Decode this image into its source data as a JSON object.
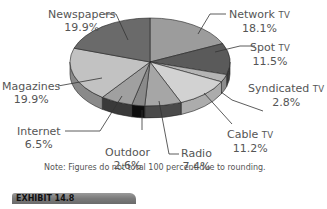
{
  "chart_data": {
    "type": "pie",
    "style": "3d-exploded-none",
    "title": "",
    "start_angle_deg": -90,
    "direction": "clockwise",
    "slices": [
      {
        "label": "Network TV",
        "value": 18.1,
        "display": "18.1%",
        "color": "#9c9c9c"
      },
      {
        "label": "Spot TV",
        "value": 11.5,
        "display": "11.5%",
        "color": "#5a5a5a"
      },
      {
        "label": "Syndicated TV",
        "value": 2.8,
        "display": "2.8%",
        "color": "#b4b4b4"
      },
      {
        "label": "Cable TV",
        "value": 11.2,
        "display": "11.2%",
        "color": "#d2d2d2"
      },
      {
        "label": "Radio",
        "value": 7.4,
        "display": "7.4%",
        "color": "#a6a6a6"
      },
      {
        "label": "Outdoor",
        "value": 2.6,
        "display": "2.6%",
        "color": "#8a8a8a"
      },
      {
        "label": "Internet",
        "value": 6.5,
        "display": "6.5%",
        "color": "#a0a0a0"
      },
      {
        "label": "Magazines",
        "value": 19.9,
        "display": "19.9%",
        "color": "#c2c2c2"
      },
      {
        "label": "Newspapers",
        "value": 19.9,
        "display": "19.9%",
        "color": "#6a6a6a"
      }
    ],
    "side_colors": [
      "#7c7c7c",
      "#3c3c3c",
      "#8c8c8c",
      "#acacac",
      "#4a4a4a",
      "#0e0e0e",
      "#3a3a3a",
      "#8a8a8a",
      "#4a4a4a"
    ],
    "annotations": [
      "Note: Figures do not total 100 percent due to rounding."
    ],
    "legend": "none (leader-line labels)"
  },
  "labels": {
    "newspapers": {
      "name": "Newspapers",
      "pct": "19.9%"
    },
    "network_tv": {
      "name": "Network",
      "suffix": "TV",
      "pct": "18.1%"
    },
    "spot_tv": {
      "name": "Spot",
      "suffix": "TV",
      "pct": "11.5%"
    },
    "syndicated_tv": {
      "name": "Syndicated",
      "suffix": "TV",
      "pct": "2.8%"
    },
    "cable_tv": {
      "name": "Cable",
      "suffix": "TV",
      "pct": "11.2%"
    },
    "radio": {
      "name": "Radio",
      "pct": "7.4%"
    },
    "outdoor": {
      "name": "Outdoor",
      "pct": "2.6%"
    },
    "internet": {
      "name": "Internet",
      "pct": "6.5%"
    },
    "magazines": {
      "name": "Magazines",
      "pct": "19.9%"
    }
  },
  "note": "Note: Figures do not total 100 percent due to rounding.",
  "exhibit": "EXHIBIT 14.8"
}
